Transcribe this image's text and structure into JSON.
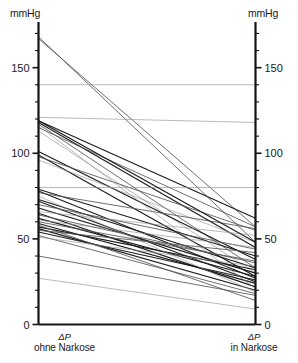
{
  "axes": {
    "unit_label_left": "mmHg",
    "unit_label_right": "mmHg",
    "left_caption_symbol": "ΔP",
    "left_caption_text": "ohne Narkose",
    "right_caption_symbol": "ΔP",
    "right_caption_text": "in Narkose",
    "tick_labels_left": [
      "0",
      "50",
      "100",
      "150"
    ],
    "tick_labels_right": [
      "0",
      "50",
      "100",
      "150"
    ]
  },
  "colors": {
    "axis": "#141414",
    "line_dark": "#1c1c1c",
    "line_mid": "#555555",
    "line_light": "#8c8c8c",
    "text": "#1a1a1a",
    "background": "#ffffff"
  },
  "chart_data": {
    "type": "line",
    "title": "",
    "subtitle": "",
    "xlabel": "",
    "ylabel": "mmHg",
    "grid": false,
    "legend": null,
    "legend_position": "none",
    "plot_kind": "paired-slope / parallel-coordinates",
    "categories": [
      "ΔP ohne Narkose",
      "ΔP in Narkose"
    ],
    "x": [
      0,
      1
    ],
    "ylim": [
      0,
      172
    ],
    "yticks_major": [
      0,
      50,
      100,
      150
    ],
    "yticks_minor": [
      10,
      20,
      30,
      40,
      60,
      70,
      80,
      90,
      110,
      120,
      130,
      140,
      160,
      170
    ],
    "annotations": [],
    "series": [
      {
        "name": "case-01",
        "values": [
          168,
          48
        ],
        "shade": "mid"
      },
      {
        "name": "case-02",
        "values": [
          167,
          57
        ],
        "shade": "mid"
      },
      {
        "name": "case-03",
        "values": [
          140,
          140
        ],
        "shade": "light"
      },
      {
        "name": "case-04",
        "values": [
          121,
          118
        ],
        "shade": "light"
      },
      {
        "name": "case-05",
        "values": [
          119,
          62
        ],
        "shade": "dark"
      },
      {
        "name": "case-06",
        "values": [
          118,
          45
        ],
        "shade": "dark"
      },
      {
        "name": "case-07",
        "values": [
          117,
          33
        ],
        "shade": "mid"
      },
      {
        "name": "case-08",
        "values": [
          115,
          57
        ],
        "shade": "mid"
      },
      {
        "name": "case-09",
        "values": [
          113,
          30
        ],
        "shade": "light"
      },
      {
        "name": "case-10",
        "values": [
          101,
          38
        ],
        "shade": "dark"
      },
      {
        "name": "case-11",
        "values": [
          99,
          28
        ],
        "shade": "dark"
      },
      {
        "name": "case-12",
        "values": [
          98,
          55
        ],
        "shade": "mid"
      },
      {
        "name": "case-13",
        "values": [
          96,
          48
        ],
        "shade": "light"
      },
      {
        "name": "case-14",
        "values": [
          80,
          80
        ],
        "shade": "light"
      },
      {
        "name": "case-15",
        "values": [
          79,
          40
        ],
        "shade": "dark"
      },
      {
        "name": "case-16",
        "values": [
          78,
          27
        ],
        "shade": "dark"
      },
      {
        "name": "case-17",
        "values": [
          77,
          56
        ],
        "shade": "mid"
      },
      {
        "name": "case-18",
        "values": [
          73,
          33
        ],
        "shade": "dark"
      },
      {
        "name": "case-19",
        "values": [
          72,
          25
        ],
        "shade": "dark"
      },
      {
        "name": "case-20",
        "values": [
          70,
          44
        ],
        "shade": "mid"
      },
      {
        "name": "case-21",
        "values": [
          68,
          30
        ],
        "shade": "dark"
      },
      {
        "name": "case-22",
        "values": [
          66,
          52
        ],
        "shade": "light"
      },
      {
        "name": "case-23",
        "values": [
          65,
          22
        ],
        "shade": "dark"
      },
      {
        "name": "case-24",
        "values": [
          64,
          36
        ],
        "shade": "mid"
      },
      {
        "name": "case-25",
        "values": [
          62,
          28
        ],
        "shade": "dark"
      },
      {
        "name": "case-26",
        "values": [
          61,
          45
        ],
        "shade": "light"
      },
      {
        "name": "case-27",
        "values": [
          59,
          24
        ],
        "shade": "dark"
      },
      {
        "name": "case-28",
        "values": [
          57,
          32
        ],
        "shade": "dark"
      },
      {
        "name": "case-29",
        "values": [
          56,
          20
        ],
        "shade": "dark"
      },
      {
        "name": "case-30",
        "values": [
          55,
          42
        ],
        "shade": "mid"
      },
      {
        "name": "case-31",
        "values": [
          54,
          26
        ],
        "shade": "dark"
      },
      {
        "name": "case-32",
        "values": [
          52,
          18
        ],
        "shade": "mid"
      },
      {
        "name": "case-33",
        "values": [
          51,
          34
        ],
        "shade": "light"
      },
      {
        "name": "case-34",
        "values": [
          40,
          17
        ],
        "shade": "mid"
      },
      {
        "name": "case-35",
        "values": [
          27,
          9
        ],
        "shade": "light"
      },
      {
        "name": "case-36",
        "values": [
          119,
          48
        ],
        "shade": "dark"
      },
      {
        "name": "case-37",
        "values": [
          116,
          21
        ],
        "shade": "light"
      },
      {
        "name": "case-38",
        "values": [
          60,
          37
        ],
        "shade": "mid"
      },
      {
        "name": "case-39",
        "values": [
          58,
          14
        ],
        "shade": "mid"
      },
      {
        "name": "case-40",
        "values": [
          75,
          19
        ],
        "shade": "light"
      }
    ]
  }
}
